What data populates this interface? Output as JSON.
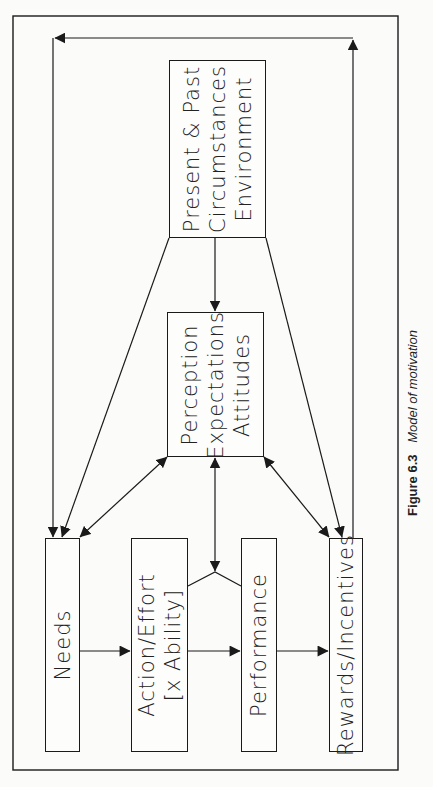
{
  "diagram": {
    "title": "Model of motivation",
    "orientation": "rotated-90-ccw",
    "colors": {
      "line": "#1a1a1a",
      "background": "#fbfbfa",
      "text": "#222222"
    },
    "nodes": {
      "present": {
        "lines": [
          "Present & Past",
          "Circumstances",
          "Environment"
        ]
      },
      "perception": {
        "lines": [
          "Perception",
          "Expectations",
          "Attitudes"
        ]
      },
      "needs": {
        "lines": [
          "Needs"
        ]
      },
      "action": {
        "lines": [
          "Action/Effort",
          "[x Ability]"
        ]
      },
      "performance": {
        "lines": [
          "Performance"
        ]
      },
      "rewards": {
        "lines": [
          "Rewards/Incentives"
        ]
      }
    },
    "edges": [
      {
        "from": "present",
        "to": "perception",
        "type": "one-way"
      },
      {
        "from": "present",
        "to": "needs",
        "type": "one-way"
      },
      {
        "from": "present",
        "to": "rewards",
        "type": "one-way"
      },
      {
        "from": "perception",
        "to": "needs",
        "type": "two-way"
      },
      {
        "from": "perception",
        "to": "rewards",
        "type": "two-way"
      },
      {
        "from": "perception",
        "to": "action-performance-link",
        "type": "two-way"
      },
      {
        "from": "needs",
        "to": "action",
        "type": "one-way"
      },
      {
        "from": "action",
        "to": "performance",
        "type": "one-way"
      },
      {
        "from": "performance",
        "to": "rewards",
        "type": "one-way"
      },
      {
        "from": "rewards",
        "to": "needs",
        "type": "feedback-loop"
      }
    ]
  },
  "caption": {
    "figure_number": "Figure 6.3",
    "figure_title": "Model of motivation"
  }
}
